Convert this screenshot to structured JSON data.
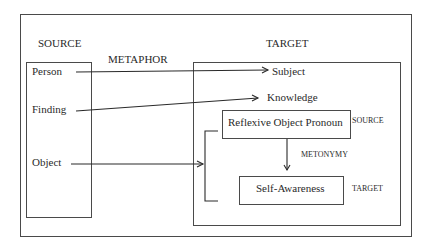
{
  "diagram": {
    "source_heading": "SOURCE",
    "target_heading": "TARGET",
    "metaphor_label": "METAPHOR",
    "source_items": [
      "Person",
      "Finding",
      "Object"
    ],
    "target_items": [
      "Subject",
      "Knowledge"
    ],
    "inner": {
      "top_box": "Reflexive Object Pronoun",
      "top_tag": "SOURCE",
      "relation": "METONYMY",
      "bottom_box": "Self-Awareness",
      "bottom_tag": "TARGET"
    }
  }
}
